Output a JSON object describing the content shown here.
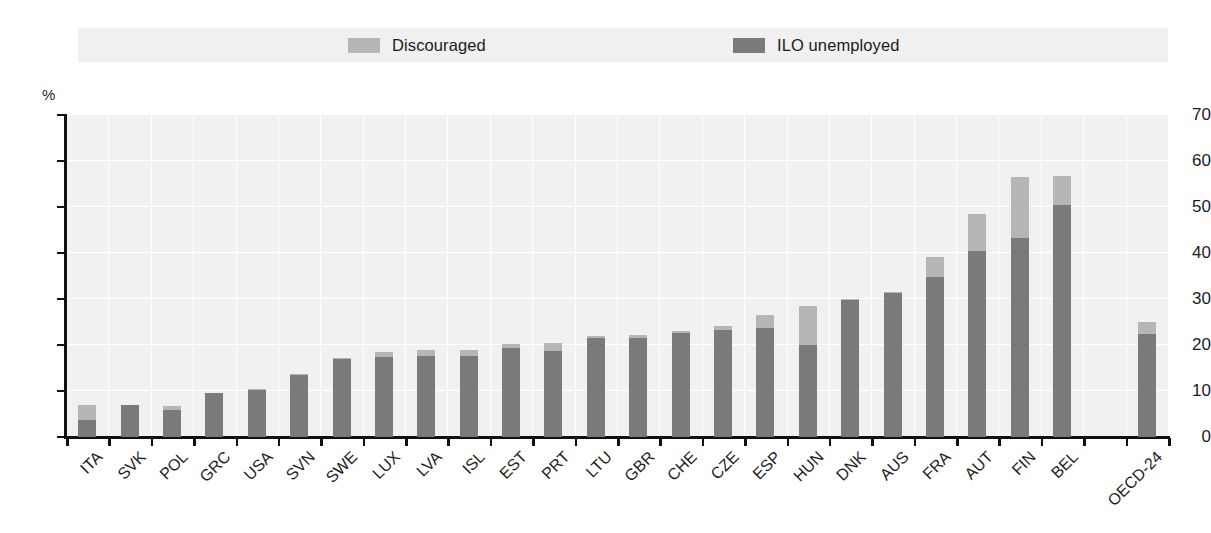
{
  "chart_data": {
    "type": "bar",
    "stacked": true,
    "title": "",
    "subtitle": "",
    "xlabel": "",
    "ylabel": "",
    "y_unit": "%",
    "ylim": [
      0,
      70
    ],
    "ytick_values": [
      0,
      10,
      20,
      30,
      40,
      50,
      60,
      70
    ],
    "ytick_labels": [
      "0",
      "10",
      "20",
      "30",
      "40",
      "50",
      "60",
      "70"
    ],
    "grid": true,
    "legend_position": "top",
    "categories": [
      "ITA",
      "SVK",
      "POL",
      "GRC",
      "USA",
      "SVN",
      "SWE",
      "LUX",
      "LVA",
      "ISL",
      "EST",
      "PRT",
      "LTU",
      "GBR",
      "CHE",
      "CZE",
      "ESP",
      "HUN",
      "DNK",
      "AUS",
      "FRA",
      "AUT",
      "FIN",
      "BEL",
      "",
      "OECD-24"
    ],
    "series": [
      {
        "name": "ILO unemployed",
        "color": "#7a7a7a",
        "values": [
          3.7,
          7.0,
          5.8,
          9.5,
          10.3,
          13.4,
          17.0,
          17.4,
          17.6,
          17.7,
          19.3,
          18.8,
          21.6,
          21.6,
          22.7,
          23.3,
          23.7,
          20.1,
          29.8,
          31.3,
          34.7,
          40.5,
          43.3,
          50.5,
          null,
          22.3
        ]
      },
      {
        "name": "Discouraged",
        "color": "#b6b6b6",
        "values": [
          3.3,
          0.0,
          1.0,
          0.0,
          0.2,
          0.4,
          0.2,
          1.0,
          1.4,
          1.2,
          0.9,
          1.7,
          0.3,
          0.5,
          0.3,
          0.8,
          2.8,
          8.4,
          0.2,
          0.2,
          4.4,
          8.0,
          13.2,
          6.3,
          null,
          2.7
        ]
      }
    ],
    "totals": [
      7.0,
      7.0,
      6.8,
      9.5,
      10.5,
      13.8,
      17.2,
      18.4,
      19.0,
      18.9,
      20.2,
      20.5,
      21.9,
      22.1,
      23.0,
      24.1,
      26.5,
      28.5,
      30.0,
      31.5,
      39.1,
      48.5,
      56.5,
      56.8,
      null,
      25.0
    ]
  },
  "legend": {
    "entries": [
      {
        "label": "Discouraged",
        "color": "#b6b6b6"
      },
      {
        "label": "ILO unemployed",
        "color": "#7a7a7a"
      }
    ]
  },
  "axes": {
    "y_unit_label": "%"
  }
}
